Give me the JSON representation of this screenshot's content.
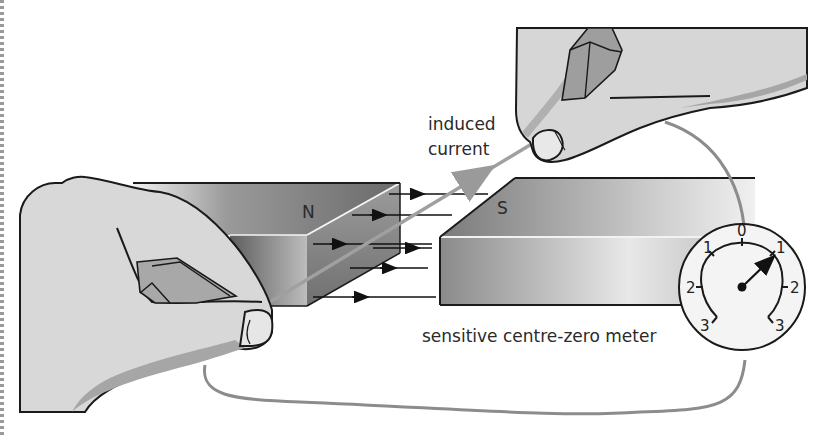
{
  "diagram": {
    "labels": {
      "induced_current": [
        "induced",
        "current"
      ],
      "meter": "sensitive centre-zero meter"
    },
    "magnets": {
      "left_pole": "N",
      "right_pole": "S"
    },
    "field_lines": {
      "count": 5,
      "direction": "N to S"
    },
    "meter": {
      "scale_left": [
        "3",
        "2",
        "1"
      ],
      "scale_centre": "0",
      "scale_right": [
        "1",
        "2",
        "3"
      ],
      "needle_reading": "1 (right)"
    },
    "colors": {
      "wire": "#8c8c8c",
      "outline": "#1a1a1a",
      "skin": "#d9d9d9",
      "skin_shadow": "#a8a8a8",
      "magnet_dark": "#6e6e6e",
      "magnet_light": "#e6e6e6"
    }
  }
}
